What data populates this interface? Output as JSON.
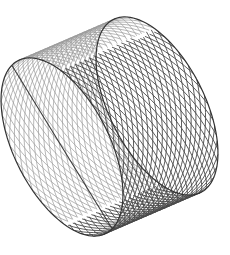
{
  "figure": {
    "background": "#ffffff",
    "line_color": "#4a4a4a",
    "rim_color": "#333333",
    "seam_color": "#3a3a3a",
    "line_width": 0.9,
    "helix_count": 36,
    "helix_turns": 0.55,
    "front_center": [
      62,
      147
    ],
    "back_center": [
      157,
      106
    ],
    "ellipse_u": [
      40,
      88
    ],
    "ellipse_v": [
      -46,
      14
    ]
  }
}
